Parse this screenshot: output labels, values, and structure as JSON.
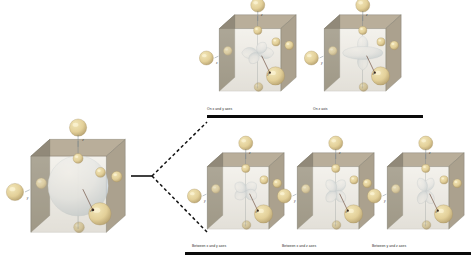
{
  "figure": {
    "type": "orbital-shape-diagram",
    "background": "#ffffff",
    "parent": {
      "name": "parent-cube",
      "orbital_shape": "sphere",
      "caption": "",
      "axis_labels": [
        "z",
        "y",
        "x"
      ],
      "x": 12,
      "y": 136,
      "w": 118,
      "h": 112,
      "scale": 1.0
    },
    "branch": {
      "name": "branch-connector",
      "solid_line": {
        "x1": 131,
        "y1": 176,
        "x2": 152,
        "y2": 176
      },
      "dashed_up": {
        "x1": 152,
        "y1": 176,
        "x2": 207,
        "y2": 122
      },
      "dashed_down": {
        "x1": 152,
        "y1": 176,
        "x2": 207,
        "y2": 232
      },
      "line_color": "#111111"
    },
    "groups": [
      {
        "id": "on-axes",
        "row": "top",
        "members": [
          {
            "id": "dx2y2",
            "caption": "On x and y axes",
            "orbital_shape": "four-lobe-on-axes",
            "axis_labels": [
              "z",
              "x",
              "y"
            ],
            "x": 204,
            "y": 12,
            "w": 96,
            "h": 92,
            "caption_x": 207,
            "caption_y": 108,
            "bar_x": 207,
            "bar_y": 115,
            "bar_w": 110
          },
          {
            "id": "dz2",
            "caption": "On z axis",
            "orbital_shape": "dumbbell-with-torus",
            "axis_labels": [
              "z",
              "y",
              "x"
            ],
            "x": 309,
            "y": 12,
            "w": 96,
            "h": 92,
            "caption_x": 313,
            "caption_y": 108,
            "bar_x": 313,
            "bar_y": 115,
            "bar_w": 110
          }
        ]
      },
      {
        "id": "between-axes",
        "row": "bottom",
        "members": [
          {
            "id": "dxy",
            "caption": "Between x and y axes",
            "orbital_shape": "four-lobe-between-axes",
            "axis_labels": [
              "z",
              "y",
              "x"
            ],
            "x": 192,
            "y": 150,
            "w": 96,
            "h": 92,
            "caption_x": 192,
            "caption_y": 245,
            "bar_x": 185,
            "bar_y": 252,
            "bar_w": 112
          },
          {
            "id": "dxz",
            "caption": "Between x and z axes",
            "orbital_shape": "four-lobe-between-xz",
            "axis_labels": [
              "z",
              "y",
              "x"
            ],
            "x": 282,
            "y": 150,
            "w": 96,
            "h": 92,
            "caption_x": 282,
            "caption_y": 245,
            "bar_x": 277,
            "bar_y": 252,
            "bar_w": 112
          },
          {
            "id": "dyz",
            "caption": "Between y and z axes",
            "orbital_shape": "four-lobe-between-yz",
            "axis_labels": [
              "z",
              "y",
              "x"
            ],
            "x": 372,
            "y": 150,
            "w": 96,
            "h": 92,
            "caption_x": 372,
            "caption_y": 245,
            "bar_x": 366,
            "bar_y": 252,
            "bar_w": 105
          }
        ]
      }
    ],
    "colors": {
      "cube_top": "#b6aa95",
      "cube_left": "#8f8878",
      "cube_right": "#a79c88",
      "cube_front_glass": "#cfc8b6",
      "cube_edge": "#6f6a5c",
      "sphere_gold_light": "#f2e6b8",
      "sphere_gold": "#e3d099",
      "sphere_gold_dark": "#b9a472",
      "orbital_light": "#f2f5f8",
      "orbital_shade": "#cdd9e2",
      "axis_line": "#6b7a86",
      "pointer_line": "#6b4a3a",
      "caption_text": "#2b2b2b",
      "bar": "#0a0a0a"
    }
  }
}
